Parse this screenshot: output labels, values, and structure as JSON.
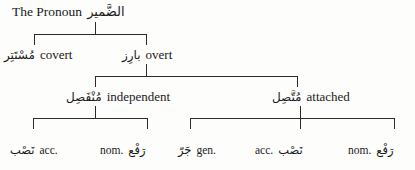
{
  "diagram": {
    "title_en": "The Pronoun",
    "title_ar": "الضَّمير",
    "line_color": "#2b2b2b",
    "background": "#fdfdfc",
    "nodes": {
      "root": {
        "en": "The Pronoun",
        "ar": "الضَّمير"
      },
      "covert": {
        "en": "covert",
        "ar": "مُسْتَتِر"
      },
      "overt": {
        "en": "overt",
        "ar": "بارِز"
      },
      "independent": {
        "en": "independent",
        "ar": "مُنْفَصِل"
      },
      "attached": {
        "en": "attached",
        "ar": "مُتَّصِل"
      },
      "indep_acc": {
        "en": "acc.",
        "ar": "نَصْب"
      },
      "indep_nom": {
        "en": "nom.",
        "ar": "رَفْع"
      },
      "att_gen": {
        "en": "gen.",
        "ar": "جَرّ"
      },
      "att_acc": {
        "en": "acc.",
        "ar": "نَصْب"
      },
      "att_nom": {
        "en": "nom.",
        "ar": "رَفْع"
      }
    }
  }
}
